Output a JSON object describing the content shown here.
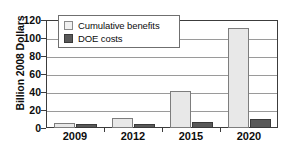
{
  "chart_data": {
    "type": "bar",
    "title": "",
    "xlabel": "",
    "ylabel": "Billion 2008 Dollars",
    "categories": [
      "2009",
      "2012",
      "2015",
      "2020"
    ],
    "series": [
      {
        "name": "Cumulative benefits",
        "values": [
          6,
          11.5,
          41,
          111
        ],
        "color": "#e8e8e8"
      },
      {
        "name": "DOE costs",
        "values": [
          4.5,
          4.5,
          6.5,
          9.5
        ],
        "color": "#595959"
      }
    ],
    "ylim": [
      0,
      120
    ],
    "yticks": [
      "0",
      "20",
      "40",
      "60",
      "80",
      "100",
      "120"
    ],
    "grid": "horizontal",
    "legend_position": "upper-left-inside"
  },
  "legend": {
    "items": [
      {
        "label": "Cumulative benefits",
        "swatch": "light-square-swatch"
      },
      {
        "label": "DOE costs",
        "swatch": "dark-square-swatch"
      }
    ]
  }
}
